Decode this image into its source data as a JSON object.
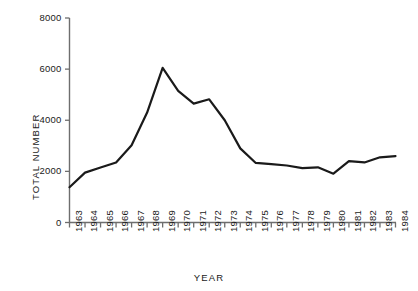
{
  "chart_data": {
    "type": "line",
    "title": "",
    "xlabel": "YEAR",
    "ylabel": "TOTAL NUMBER",
    "xlim": [
      1963,
      1984
    ],
    "ylim": [
      0,
      8000
    ],
    "yticks": [
      0,
      2000,
      4000,
      6000,
      8000
    ],
    "ytick_labels": [
      "0",
      "2000",
      "4000",
      "6000",
      "8000"
    ],
    "grid": false,
    "legend": null,
    "categories": [
      "1963",
      "1964",
      "1965",
      "1966",
      "1967",
      "1968",
      "1969",
      "1970",
      "1971",
      "1972",
      "1973",
      "1974",
      "1975",
      "1976",
      "1977",
      "1978",
      "1979",
      "1980",
      "1981",
      "1982",
      "1983",
      "1984"
    ],
    "values": [
      1380,
      1950,
      2150,
      2350,
      3020,
      4300,
      6050,
      5150,
      4650,
      4820,
      4000,
      2900,
      2330,
      2280,
      2230,
      2130,
      2160,
      1910,
      2400,
      2350,
      2550,
      2600
    ],
    "series": [
      {
        "name": "total",
        "values": [
          1380,
          1950,
          2150,
          2350,
          3020,
          4300,
          6050,
          5150,
          4650,
          4820,
          4000,
          2900,
          2330,
          2280,
          2230,
          2130,
          2160,
          1910,
          2400,
          2350,
          2550,
          2600
        ],
        "color": "#1a1a1a",
        "line_width": 2.2
      }
    ]
  },
  "axes": {
    "y_axis_name": "vertical-axis",
    "x_axis_name": "horizontal-axis"
  }
}
